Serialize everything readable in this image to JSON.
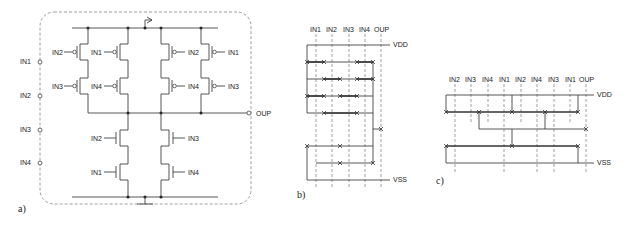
{
  "panel_a": {
    "caption": "a)",
    "inputs": [
      "IN1",
      "IN2",
      "IN3",
      "IN4"
    ],
    "output": "OUP",
    "pmos_left_col1": [
      "IN2",
      "IN3"
    ],
    "pmos_left_col2": [
      "IN1",
      "IN4"
    ],
    "pmos_right_col1": [
      "IN2",
      "IN4"
    ],
    "pmos_right_col2": [
      "IN1",
      "IN3"
    ],
    "nmos_left": [
      "IN2",
      "IN1"
    ],
    "nmos_right": [
      "IN3",
      "IN4"
    ]
  },
  "panel_b": {
    "caption": "b)",
    "columns": [
      "IN1",
      "IN2",
      "IN3",
      "IN4",
      "OUP"
    ],
    "rails": {
      "top": "VDD",
      "bottom": "VSS"
    }
  },
  "panel_c": {
    "caption": "c)",
    "columns": [
      "IN2",
      "IN3",
      "IN4",
      "IN1",
      "IN2",
      "IN4",
      "IN3",
      "IN1",
      "OUP"
    ],
    "rails": {
      "top": "VDD",
      "bottom": "VSS"
    }
  }
}
